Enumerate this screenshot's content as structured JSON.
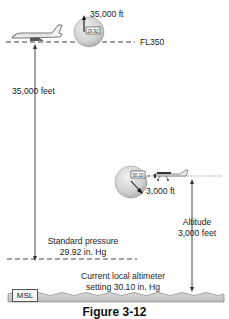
{
  "diagram": {
    "upper_aircraft": {
      "type": "jet airliner",
      "indicated_altitude_label": "35,000 ft",
      "altimeter_setting_window": "29.92",
      "flight_level_label": "FL350",
      "height_label": "35,000 feet"
    },
    "lower_aircraft": {
      "type": "light single-engine airplane",
      "altimeter_setting_window": "30.10",
      "indicated_altitude_label": "3,000 ft",
      "altitude_label_line1": "Altitude",
      "altitude_label_line2": "3,000 feet"
    },
    "standard_pressure": {
      "line1": "Standard pressure",
      "line2": "29.92 in. Hg"
    },
    "local_altimeter": {
      "line1": "Current local altimeter",
      "line2": "setting 30.10 in. Hg"
    },
    "sea_level_label": "MSL",
    "caption": "Figure 3-12"
  }
}
